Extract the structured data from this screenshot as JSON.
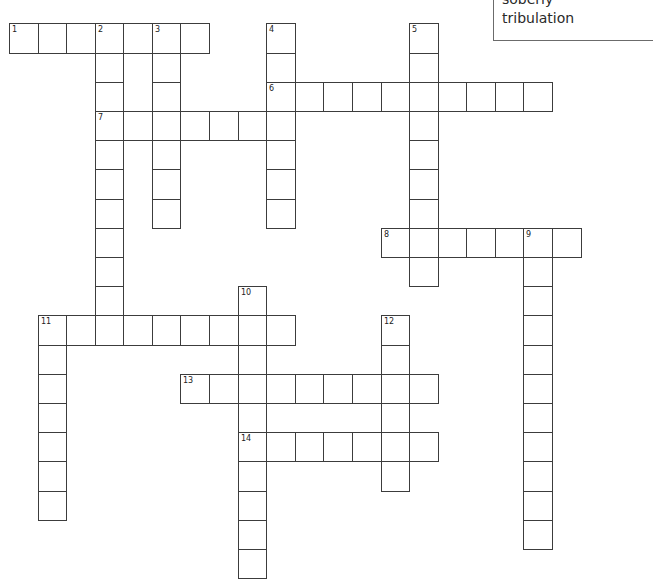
{
  "word_bank": {
    "words": [
      "soberly",
      "tribulation"
    ]
  },
  "grid": {
    "origin_x": 9,
    "origin_y": 23.4,
    "cell_width": 28.58,
    "cell_height": 29.2,
    "border_color": "#3c3c3c"
  },
  "entries": [
    {
      "number": "1",
      "direction": "across",
      "col": 0,
      "row": 0,
      "length": 7
    },
    {
      "number": "2",
      "direction": "down",
      "col": 3,
      "row": 0,
      "length": 11
    },
    {
      "number": "3",
      "direction": "down",
      "col": 5,
      "row": 0,
      "length": 7
    },
    {
      "number": "4",
      "direction": "down",
      "col": 9,
      "row": 0,
      "length": 7
    },
    {
      "number": "5",
      "direction": "down",
      "col": 14,
      "row": 0,
      "length": 9
    },
    {
      "number": "6",
      "direction": "across",
      "col": 9,
      "row": 2,
      "length": 10
    },
    {
      "number": "7",
      "direction": "across",
      "col": 3,
      "row": 3,
      "length": 7
    },
    {
      "number": "8",
      "direction": "across",
      "col": 13,
      "row": 7,
      "length": 7
    },
    {
      "number": "9",
      "direction": "down",
      "col": 18,
      "row": 7,
      "length": 11
    },
    {
      "number": "10",
      "direction": "down",
      "col": 8,
      "row": 9,
      "length": 10
    },
    {
      "number": "11",
      "direction": "across",
      "col": 1,
      "row": 10,
      "length": 9
    },
    {
      "number": "11",
      "direction": "down",
      "col": 1,
      "row": 10,
      "length": 7
    },
    {
      "number": "12",
      "direction": "down",
      "col": 13,
      "row": 10,
      "length": 6
    },
    {
      "number": "13",
      "direction": "across",
      "col": 6,
      "row": 12,
      "length": 9
    },
    {
      "number": "14",
      "direction": "across",
      "col": 8,
      "row": 14,
      "length": 7
    }
  ]
}
